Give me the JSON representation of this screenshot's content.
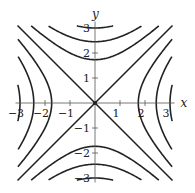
{
  "chart_data": {
    "type": "line",
    "title": "",
    "subtitle": "Level curves of f(x, y) = x^2 - y^2",
    "xlabel": "x",
    "ylabel": "y",
    "xlim": [
      -3.1,
      3.1
    ],
    "ylim": [
      -3.1,
      3.1
    ],
    "grid": false,
    "legend": null,
    "x_ticks": [
      -3,
      -2,
      -1,
      1,
      2,
      3
    ],
    "x_tick_labels": [
      "−3",
      "−2",
      "−1",
      "1",
      "2",
      "3"
    ],
    "y_ticks": [
      -3,
      -2,
      -1,
      1,
      2,
      3
    ],
    "y_tick_labels": [
      "−3",
      "−2",
      "−1",
      "1",
      "2",
      "3"
    ],
    "levels": [
      -9,
      -6,
      -3,
      0,
      3,
      6,
      9
    ],
    "series": [
      {
        "name": "x^2 - y^2 = 9",
        "level": 9,
        "vertex": [
          3,
          0
        ]
      },
      {
        "name": "x^2 - y^2 = 6",
        "level": 6,
        "vertex": [
          2.45,
          0
        ]
      },
      {
        "name": "x^2 - y^2 = 3",
        "level": 3,
        "vertex": [
          1.73,
          0
        ]
      },
      {
        "name": "x^2 - y^2 = 0",
        "level": 0,
        "lines": [
          "y = x",
          "y = -x"
        ]
      },
      {
        "name": "x^2 - y^2 = -3",
        "level": -3,
        "vertex": [
          0,
          1.73
        ]
      },
      {
        "name": "x^2 - y^2 = -6",
        "level": -6,
        "vertex": [
          0,
          2.45
        ]
      },
      {
        "name": "x^2 - y^2 = -9",
        "level": -9,
        "vertex": [
          0,
          3
        ]
      }
    ]
  },
  "layout": {
    "origin_px": [
      95,
      103
    ],
    "unit_px": 25,
    "line_color": "#222222",
    "axis_color": "#555555"
  }
}
